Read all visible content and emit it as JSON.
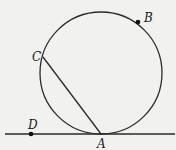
{
  "diagram": {
    "colors": {
      "stroke": "#2a2a2a",
      "background": "#f1f1ef"
    },
    "circle": {
      "cx": 101,
      "cy": 73,
      "r": 61
    },
    "tangent_line": {
      "x1": 5,
      "y1": 134,
      "x2": 175,
      "y2": 134
    },
    "chord": {
      "from": "C",
      "to": "A"
    },
    "points": [
      {
        "id": "A",
        "label": "A",
        "x": 101,
        "y": 134,
        "dot": false,
        "label_x": 97,
        "label_y": 148
      },
      {
        "id": "B",
        "label": "B",
        "x": 138,
        "y": 22,
        "dot": true,
        "label_x": 144,
        "label_y": 22
      },
      {
        "id": "C",
        "label": "C",
        "x": 43,
        "y": 57,
        "dot": false,
        "label_x": 32,
        "label_y": 61
      },
      {
        "id": "D",
        "label": "D",
        "x": 31,
        "y": 134,
        "dot": true,
        "label_x": 28,
        "label_y": 129
      }
    ]
  }
}
